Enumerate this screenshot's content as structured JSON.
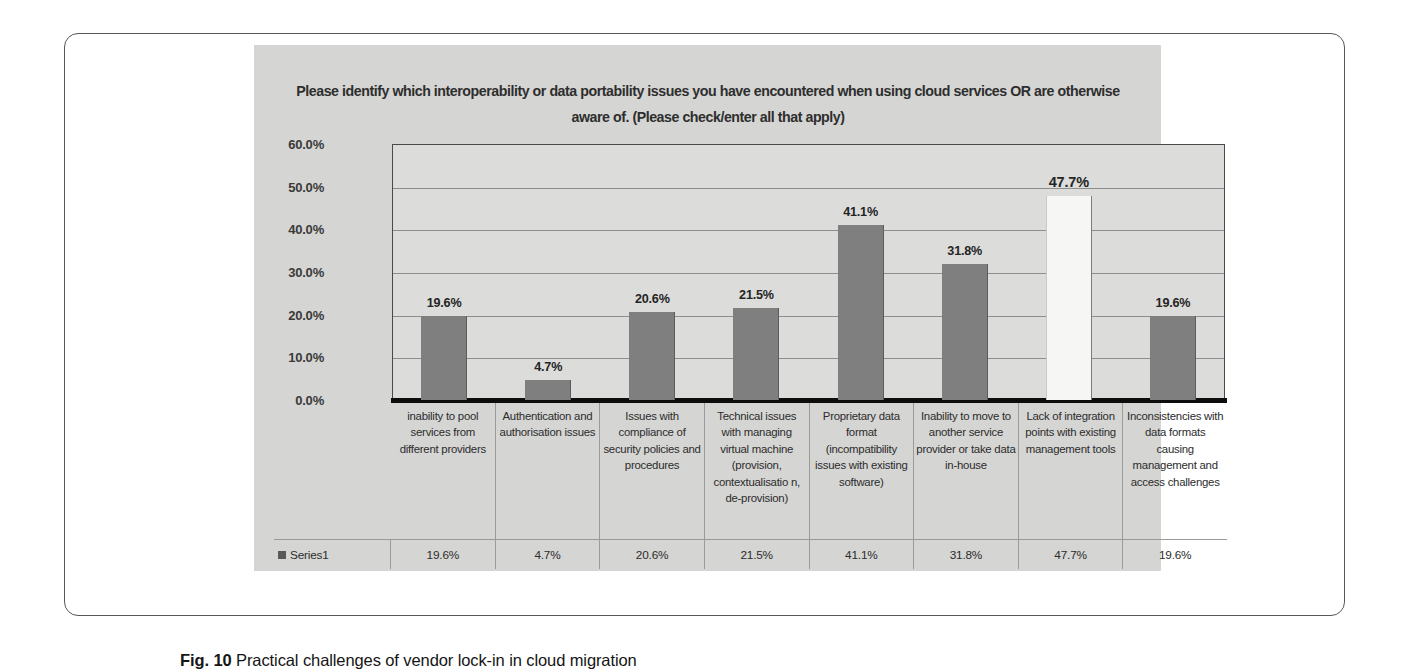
{
  "caption": {
    "label": "Fig. 10",
    "text": "Practical challenges of vendor lock-in in cloud migration"
  },
  "legend": {
    "series_name": "Series1",
    "swatch_color": "#5a5a5a"
  },
  "colors": {
    "panel_background": "#d5d5d3",
    "plot_background": "#dcdcda",
    "bar_fill": "#807f80",
    "bar_highlight_fill": "#f6f6f4",
    "axis_line": "#0d0d0d",
    "gridline": "#8e8e8e",
    "text": "#2c2c2c"
  },
  "chart_data": {
    "type": "bar",
    "title": "Please identify which interoperability or data portability issues you have encountered when using cloud services OR are otherwise aware of. (Please check/enter all that apply)",
    "xlabel": "",
    "ylabel": "",
    "ylim": [
      0,
      60
    ],
    "ytick_labels": [
      "60.0%",
      "50.0%",
      "40.0%",
      "30.0%",
      "20.0%",
      "10.0%",
      "0.0%"
    ],
    "ytick_values": [
      60,
      50,
      40,
      30,
      20,
      10,
      0
    ],
    "grid": true,
    "legend_position": "bottom-table",
    "series_name": "Series1",
    "categories": [
      "inability to pool services from different providers",
      "Authentication and authorisation issues",
      "Issues with compliance of security policies and procedures",
      "Technical issues with managing virtual machine (provision, contextualisatio n, de-provision)",
      "Proprietary data format (incompatibility issues with existing software)",
      "Inability to move to another service provider or take data in-house",
      "Lack of integration points with existing management tools",
      "Inconsistencies with data formats causing management and access challenges"
    ],
    "values": [
      19.6,
      4.7,
      20.6,
      21.5,
      41.1,
      31.8,
      47.7,
      19.6
    ],
    "value_labels": [
      "19.6%",
      "4.7%",
      "20.6%",
      "21.5%",
      "41.1%",
      "31.8%",
      "47.7%",
      "19.6%"
    ],
    "highlighted_index": 6
  }
}
